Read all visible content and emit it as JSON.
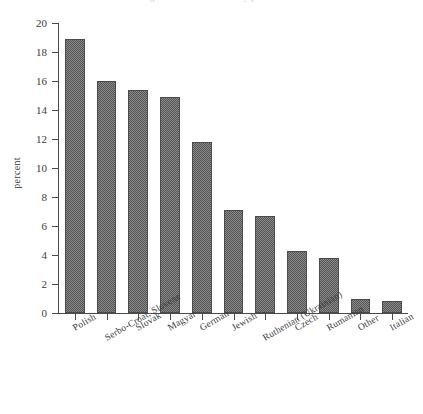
{
  "figure": {
    "title_remnant": "Figure 1.  Nationalities by percent",
    "background_color": "#ffffff",
    "bar_color": "#565656",
    "axis_color": "#4a4a4a"
  },
  "chart_data": {
    "type": "bar",
    "title": "",
    "xlabel": "",
    "ylabel": "percent",
    "ylim": [
      0,
      20
    ],
    "ytick_step": 2,
    "ytick_labels": [
      "0",
      "2",
      "4",
      "6",
      "8",
      "10",
      "12",
      "14",
      "16",
      "18",
      "20"
    ],
    "grid": false,
    "legend": false,
    "categories": [
      "Polish",
      "Serbo-Croat, Slovene",
      "Slovak",
      "Magyar",
      "German",
      "Jewish",
      "Ruthenian (Ukrainian)",
      "Czech",
      "Rumanian",
      "Other",
      "Italian"
    ],
    "values": [
      18.9,
      16.0,
      15.4,
      14.9,
      11.8,
      7.1,
      6.7,
      4.3,
      3.8,
      1.0,
      0.8
    ]
  }
}
